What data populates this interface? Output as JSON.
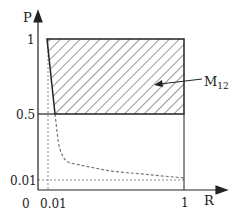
{
  "diagram": {
    "axes": {
      "y_label": "P",
      "x_label": "R",
      "origin_label": "0"
    },
    "y_ticks": [
      {
        "label": "1",
        "value": 1
      },
      {
        "label": "0.5",
        "value": 0.5
      },
      {
        "label": "0.01",
        "value": 0.01
      }
    ],
    "x_ticks": [
      {
        "label": "0.01",
        "value": 0.01
      },
      {
        "label": "1",
        "value": 1
      }
    ],
    "region": {
      "label_main": "M",
      "label_sub": "12",
      "fill": "hatched",
      "bounds": {
        "p_min": 0.5,
        "p_max": 1,
        "r_max": 1
      }
    },
    "colors": {
      "line": "#222222",
      "dotted": "#888888",
      "hatch": "#333333"
    }
  }
}
